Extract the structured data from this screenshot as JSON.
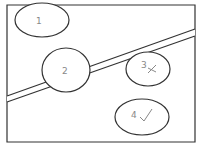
{
  "diagram": {
    "frame": {
      "x": 7,
      "y": 5,
      "width": 188,
      "height": 137
    },
    "band": {
      "upper": {
        "x1": 7,
        "y1": 96,
        "x2": 195,
        "y2": 29
      },
      "lower": {
        "x1": 7,
        "y1": 102,
        "x2": 195,
        "y2": 36
      }
    },
    "regions": [
      {
        "id": "1",
        "label": "1",
        "mark": ""
      },
      {
        "id": "2",
        "label": "2",
        "mark": ""
      },
      {
        "id": "3",
        "label": "3",
        "mark": "cross"
      },
      {
        "id": "4",
        "label": "4",
        "mark": "check"
      }
    ],
    "colors": {
      "line": "#333333",
      "label": "#888888",
      "background": "#ffffff"
    }
  }
}
